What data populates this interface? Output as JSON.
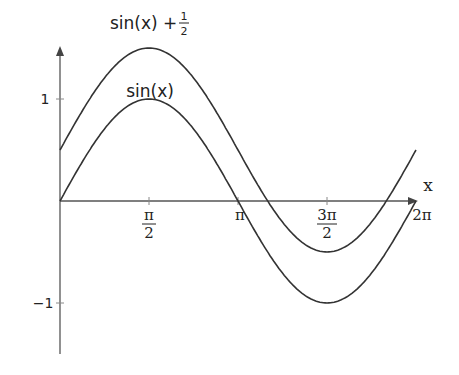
{
  "chart_data": {
    "type": "line",
    "title": "",
    "xlabel": "x",
    "ylabel": "",
    "x_range": [
      0,
      6.2832
    ],
    "ylim": [
      -1.5,
      1.5
    ],
    "grid": false,
    "legend": "inline labels",
    "x_ticks": [
      {
        "value": 1.5708,
        "num": "π",
        "den": "2"
      },
      {
        "value": 3.1416,
        "label": "π"
      },
      {
        "value": 4.7124,
        "num": "3π",
        "den": "2"
      },
      {
        "value": 6.2832,
        "label": "2π"
      }
    ],
    "y_ticks": [
      {
        "value": 1,
        "label": "1"
      },
      {
        "value": -1,
        "label": "−1"
      }
    ],
    "series": [
      {
        "name": "sin(x)",
        "formula": "sin(x)",
        "offset": 0,
        "x": [
          0,
          0.7854,
          1.5708,
          2.3562,
          3.1416,
          3.927,
          4.7124,
          5.4978,
          6.2832
        ],
        "values": [
          0,
          0.707,
          1,
          0.707,
          0,
          -0.707,
          -1,
          -0.707,
          0
        ]
      },
      {
        "name": "sin(x) + 1/2",
        "formula": "sin(x) + 1/2",
        "offset": 0.5,
        "x": [
          0,
          0.7854,
          1.5708,
          2.3562,
          3.1416,
          3.927,
          4.7124,
          5.4978,
          6.2832
        ],
        "values": [
          0.5,
          1.207,
          1.5,
          1.207,
          0.5,
          -0.207,
          -0.5,
          -0.207,
          0.5
        ]
      }
    ],
    "annotations": [
      {
        "text": "sin(x) + ",
        "frac_num": "1",
        "frac_den": "2",
        "near": "peak of upper curve"
      },
      {
        "text": "sin(x)",
        "near": "peak of lower curve"
      }
    ]
  },
  "labels": {
    "upper_curve_main": "sin(x) + ",
    "upper_curve_frac_num": "1",
    "upper_curve_frac_den": "2",
    "lower_curve": "sin(x)",
    "x_axis": "x",
    "y_tick_pos": "1",
    "y_tick_neg": "−1",
    "x_tick_pi_half_num": "π",
    "x_tick_pi_half_den": "2",
    "x_tick_pi": "π",
    "x_tick_3pi_half_num": "3π",
    "x_tick_3pi_half_den": "2",
    "x_tick_2pi": "2π"
  }
}
